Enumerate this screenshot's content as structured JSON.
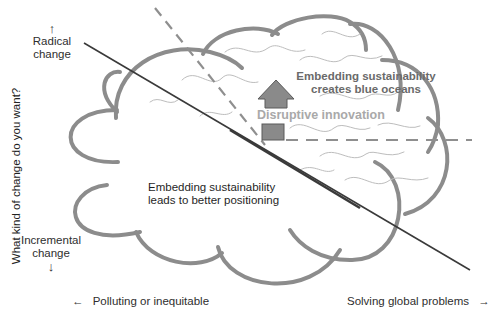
{
  "diagram": {
    "y_axis": {
      "title": "What kind of change do you want?",
      "top_label_line1": "Radical",
      "top_label_line2": "change",
      "top_arrow": "↑",
      "bottom_label_line1": "Incremental",
      "bottom_label_line2": "change",
      "bottom_arrow": "↓"
    },
    "x_axis": {
      "left_arrow": "←",
      "left_label": "Polluting or inequitable",
      "right_label": "Solving global problems",
      "right_arrow": "→"
    },
    "regions": {
      "upper_right_line1": "Embedding sustainability",
      "upper_right_line2": "creates blue oceans",
      "arrow_label": "Disruptive innovation",
      "lower_left_line1": "Embedding sustainability",
      "lower_left_line2": "leads to better positioning"
    },
    "colors": {
      "cloud_outline": "#8c8c8c",
      "diagonal_line": "#3a3a3a",
      "dashed_line": "#8f8f8f",
      "arrow_fill": "#8a8a8a",
      "arrow_stroke": "#5a5a5a",
      "wave_lines": "#bdbdbd",
      "blue_ocean_text": "#6a6a6a",
      "disruptive_text": "#a9a9a9"
    }
  }
}
